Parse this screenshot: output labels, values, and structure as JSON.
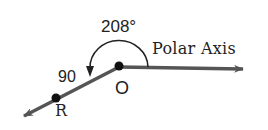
{
  "diagram": {
    "type": "polar-coordinate-plot",
    "labels": {
      "angle": "208°",
      "polar_axis": "Polar Axis",
      "radius": "90",
      "origin": "O",
      "point": "R"
    },
    "point": {
      "name": "R",
      "r": 90,
      "theta_deg": 208
    },
    "colors": {
      "line": "#555555",
      "dot": "#111111",
      "text": "#222222",
      "background": "#ffffff"
    }
  }
}
